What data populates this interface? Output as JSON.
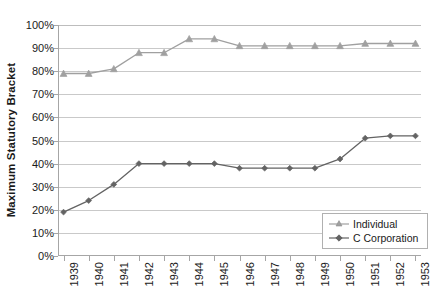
{
  "chart_data": {
    "type": "line",
    "title": "",
    "xlabel": "",
    "ylabel": "Maximum Statutory Bracket",
    "categories": [
      "1939",
      "1940",
      "1941",
      "1942",
      "1943",
      "1944",
      "1945",
      "1946",
      "1947",
      "1948",
      "1949",
      "1950",
      "1951",
      "1952",
      "1953"
    ],
    "ylim": [
      0,
      100
    ],
    "y_ticks": [
      "0%",
      "10%",
      "20%",
      "30%",
      "40%",
      "50%",
      "60%",
      "70%",
      "80%",
      "90%",
      "100%"
    ],
    "y_tick_values": [
      0,
      10,
      20,
      30,
      40,
      50,
      60,
      70,
      80,
      90,
      100
    ],
    "grid": true,
    "legend_position": "bottom-right",
    "series": [
      {
        "name": "Individual",
        "color": "#a0a0a0",
        "marker": "triangle",
        "values": [
          79,
          79,
          81,
          88,
          88,
          94,
          94,
          91,
          91,
          91,
          91,
          91,
          92,
          92,
          92
        ]
      },
      {
        "name": "C Corporation",
        "color": "#636363",
        "marker": "diamond",
        "values": [
          19,
          24,
          31,
          40,
          40,
          40,
          40,
          38,
          38,
          38,
          38,
          42,
          51,
          52,
          52
        ]
      }
    ]
  },
  "axis": {
    "y_title": "Maximum Statutory Bracket"
  },
  "legend": {
    "items": [
      {
        "label": "Individual"
      },
      {
        "label": "C Corporation"
      }
    ]
  },
  "colors": {
    "individual": "#a0a0a0",
    "c_corporation": "#636363",
    "gridline": "#c9c9c9",
    "axis": "#a6a6a6",
    "text": "#1a1a1a",
    "background": "#ffffff"
  }
}
